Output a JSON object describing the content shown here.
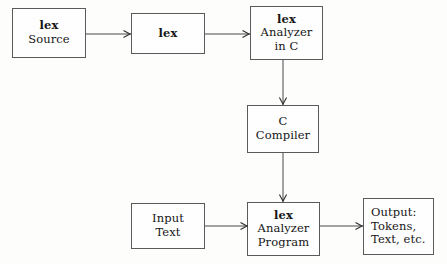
{
  "diagram": {
    "colors": {
      "border": "#5a5a5a",
      "arrow": "#4a4a4a",
      "text": "#161616",
      "background": "#fdfdfc"
    },
    "nodes": [
      {
        "id": "lex-source",
        "lines": [
          {
            "text": "lex",
            "bold": true
          },
          {
            "text": "Source",
            "bold": false
          }
        ]
      },
      {
        "id": "lex",
        "lines": [
          {
            "text": "lex",
            "bold": true
          }
        ]
      },
      {
        "id": "lex-analyzer-in-c",
        "lines": [
          {
            "text": "lex",
            "bold": true
          },
          {
            "text": "Analyzer",
            "bold": false
          },
          {
            "text": "in C",
            "bold": false
          }
        ]
      },
      {
        "id": "c-compiler",
        "lines": [
          {
            "text": "C",
            "bold": false
          },
          {
            "text": "Compiler",
            "bold": false
          }
        ]
      },
      {
        "id": "input-text",
        "lines": [
          {
            "text": "Input",
            "bold": false
          },
          {
            "text": "Text",
            "bold": false
          }
        ]
      },
      {
        "id": "lex-analyzer-program",
        "lines": [
          {
            "text": "lex",
            "bold": true
          },
          {
            "text": "Analyzer",
            "bold": false
          },
          {
            "text": "Program",
            "bold": false
          }
        ]
      },
      {
        "id": "output",
        "lines": [
          {
            "text": "Output:",
            "bold": false
          },
          {
            "text": "Tokens,",
            "bold": false
          },
          {
            "text": "Text, etc.",
            "bold": false
          }
        ]
      }
    ],
    "edges": [
      {
        "id": "source-to-lex",
        "from": "lex-source",
        "to": "lex",
        "direction": "right"
      },
      {
        "id": "lex-to-analyzer",
        "from": "lex",
        "to": "lex-analyzer-in-c",
        "direction": "right"
      },
      {
        "id": "analyzer-to-compiler",
        "from": "lex-analyzer-in-c",
        "to": "c-compiler",
        "direction": "down"
      },
      {
        "id": "compiler-to-program",
        "from": "c-compiler",
        "to": "lex-analyzer-program",
        "direction": "down"
      },
      {
        "id": "input-to-program",
        "from": "input-text",
        "to": "lex-analyzer-program",
        "direction": "right"
      },
      {
        "id": "program-to-output",
        "from": "lex-analyzer-program",
        "to": "output",
        "direction": "right"
      }
    ]
  }
}
